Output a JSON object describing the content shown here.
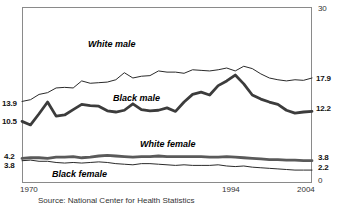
{
  "chart_data": {
    "type": "line",
    "title": "",
    "xlabel": "",
    "ylabel": "",
    "xlim": [
      1970,
      2004
    ],
    "ylim": [
      0,
      30
    ],
    "grid": false,
    "legend_position": "inline-labels",
    "x": [
      1970,
      1971,
      1972,
      1973,
      1974,
      1975,
      1976,
      1977,
      1978,
      1979,
      1980,
      1981,
      1982,
      1983,
      1984,
      1985,
      1986,
      1987,
      1988,
      1989,
      1990,
      1991,
      1992,
      1993,
      1994,
      1995,
      1996,
      1997,
      1998,
      1999,
      2000,
      2001,
      2002,
      2003,
      2004
    ],
    "series": [
      {
        "name": "White male",
        "style": "thin",
        "color": "#2a2a2a",
        "start_value": 13.9,
        "end_value": 17.9,
        "values": [
          13.9,
          14.2,
          15.1,
          15.4,
          16.2,
          16.3,
          16.2,
          17.4,
          17.0,
          17.1,
          17.2,
          17.6,
          18.8,
          17.9,
          18.2,
          18.3,
          19.1,
          18.9,
          18.9,
          18.7,
          19.3,
          19.2,
          19.1,
          19.3,
          19.6,
          19.1,
          19.9,
          19.5,
          18.6,
          17.9,
          17.6,
          17.4,
          17.6,
          17.5,
          17.9
        ]
      },
      {
        "name": "Black male",
        "style": "thick",
        "color": "#3c3c3c",
        "start_value": 10.5,
        "end_value": 12.2,
        "values": [
          10.5,
          9.9,
          11.8,
          13.8,
          11.4,
          11.6,
          12.5,
          13.4,
          13.2,
          13.1,
          12.3,
          12.1,
          12.4,
          13.5,
          12.5,
          12.3,
          12.4,
          12.8,
          12.2,
          13.8,
          15.1,
          15.5,
          15.0,
          16.6,
          17.4,
          18.4,
          16.9,
          15.0,
          14.3,
          13.8,
          13.4,
          12.4,
          11.9,
          12.1,
          12.2
        ]
      },
      {
        "name": "White female",
        "style": "thick",
        "color": "#5a5a5a",
        "start_value": 4.2,
        "end_value": 3.8,
        "values": [
          4.2,
          4.3,
          4.3,
          4.2,
          4.4,
          4.4,
          4.5,
          4.3,
          4.4,
          4.6,
          4.7,
          4.6,
          4.5,
          4.4,
          4.5,
          4.5,
          4.6,
          4.5,
          4.5,
          4.5,
          4.5,
          4.5,
          4.4,
          4.4,
          4.5,
          4.4,
          4.3,
          4.2,
          4.1,
          4.0,
          4.0,
          3.9,
          3.9,
          3.8,
          3.8
        ]
      },
      {
        "name": "Black female",
        "style": "thin",
        "color": "#2a2a2a",
        "start_value": 3.8,
        "end_value": 2.2,
        "values": [
          3.8,
          3.9,
          3.7,
          3.7,
          3.5,
          3.4,
          3.5,
          3.4,
          3.5,
          3.6,
          3.5,
          3.3,
          3.2,
          3.1,
          3.3,
          3.3,
          3.2,
          3.1,
          3.0,
          3.1,
          3.0,
          3.0,
          3.0,
          3.1,
          2.9,
          2.8,
          2.9,
          2.7,
          2.6,
          2.5,
          2.4,
          2.3,
          2.2,
          2.2,
          2.2
        ]
      }
    ],
    "left_axis_ticks": [
      {
        "label": "13.9",
        "value": 13.9
      },
      {
        "label": "10.5",
        "value": 10.5
      },
      {
        "label": "4.2",
        "value": 4.2
      },
      {
        "label": "3.8",
        "value": 3.8
      }
    ],
    "right_axis_ticks": [
      {
        "label": "30",
        "value": 30
      },
      {
        "label": "17.9",
        "value": 17.9
      },
      {
        "label": "12.2",
        "value": 12.2
      },
      {
        "label": "3.8",
        "value": 3.8
      },
      {
        "label": "2.2",
        "value": 2.2
      },
      {
        "label": "0",
        "value": 0
      }
    ],
    "x_axis_ticks": [
      {
        "label": "1970",
        "value": 1970
      },
      {
        "label": "1994",
        "value": 1994
      },
      {
        "label": "2004",
        "value": 2004
      }
    ]
  },
  "axis": {
    "left": {
      "t1": "13.9",
      "t2": "10.5",
      "t3": "4.2",
      "t4": "3.8"
    },
    "right": {
      "t_top": "30",
      "t1": "17.9",
      "t2": "12.2",
      "t3": "3.8",
      "t4": "2.2",
      "t_zero": "0"
    },
    "x": {
      "start": "1970",
      "mid": "1994",
      "end": "2004"
    }
  },
  "labels": {
    "white_male": "White male",
    "black_male": "Black male",
    "white_female": "White female",
    "black_female": "Black female"
  },
  "footer": {
    "source": "Source: National Center for Health Statistics"
  }
}
